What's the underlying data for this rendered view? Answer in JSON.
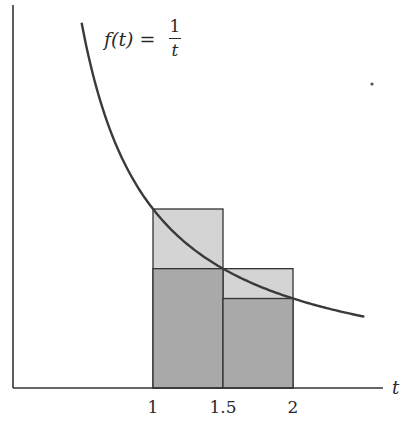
{
  "chart_data": {
    "type": "area",
    "title": "",
    "function_label": {
      "lhs": "f(t)",
      "equals": "=",
      "numerator": "1",
      "denominator": "t"
    },
    "xlabel": "t",
    "ylabel": "",
    "x_ticks": [
      {
        "value": 1,
        "label": "1"
      },
      {
        "value": 1.5,
        "label": "1.5"
      },
      {
        "value": 2,
        "label": "2"
      }
    ],
    "xlim": [
      0,
      2.65
    ],
    "ylim": [
      0,
      2.1
    ],
    "grid": false,
    "curve": {
      "name": "f(t) = 1/t",
      "t_start": 0.49,
      "t_end": 2.51,
      "color": "#3a3a3a"
    },
    "rectangles": [
      {
        "name": "upper-sum-1",
        "x0": 1.0,
        "x1": 1.5,
        "height": 1.0,
        "fill": "#d4d4d4"
      },
      {
        "name": "upper-sum-2",
        "x0": 1.5,
        "x1": 2.0,
        "height": 0.6667,
        "fill": "#d4d4d4"
      },
      {
        "name": "lower-sum-1",
        "x0": 1.0,
        "x1": 1.5,
        "height": 0.6667,
        "fill": "#a9a9a9"
      },
      {
        "name": "lower-sum-2",
        "x0": 1.5,
        "x1": 2.0,
        "height": 0.5,
        "fill": "#a9a9a9"
      }
    ],
    "sample_points": [
      {
        "t": 1.0,
        "f": 1.0
      },
      {
        "t": 1.5,
        "f": 0.6667
      },
      {
        "t": 2.0,
        "f": 0.5
      }
    ],
    "annotations": [
      "f(t) = 1/t"
    ]
  },
  "colors": {
    "axis": "#333333",
    "curve": "#3a3a3a",
    "upper_fill": "#d4d4d4",
    "lower_fill": "#a9a9a9",
    "outline": "#333333"
  }
}
